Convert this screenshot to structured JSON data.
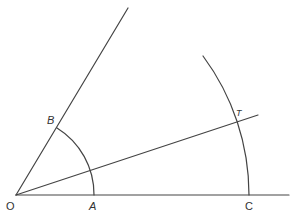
{
  "diagram": {
    "colors": {
      "line": "#444444",
      "label": "#333333",
      "background": "#ffffff"
    },
    "points": {
      "O": {
        "label": "O",
        "x": 16,
        "y": 195
      },
      "A": {
        "label": "A",
        "x": 94,
        "y": 195
      },
      "B": {
        "label": "B",
        "x": 57,
        "y": 127
      },
      "C": {
        "label": "C",
        "x": 249,
        "y": 195
      },
      "T": {
        "label": "T",
        "x": 237,
        "y": 121
      }
    },
    "labels": {
      "O": "O",
      "A": "A",
      "B": "B",
      "C": "C",
      "T": "T"
    }
  }
}
